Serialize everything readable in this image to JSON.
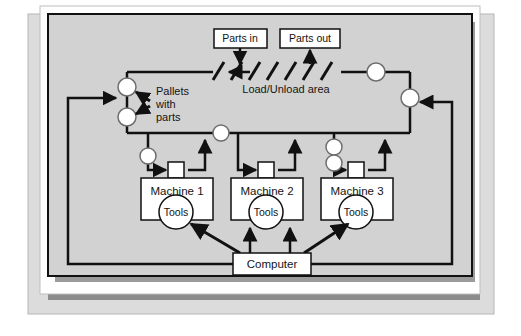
{
  "diagram": {
    "colors": {
      "page_background": "#ffffff",
      "outer_panel": "#dcdcdc",
      "card": "#ffffff",
      "inner_panel": "#d2d2d2",
      "shadow": "#8c8c8c",
      "line": "#111111",
      "node_fill": "#ffffff",
      "box_fill": "#ffffff"
    },
    "boxes": [
      {
        "id": "parts-in",
        "label": "Parts in",
        "x": 214,
        "y": 29,
        "w": 53,
        "h": 19
      },
      {
        "id": "parts-out",
        "label": "Parts out",
        "x": 280,
        "y": 29,
        "w": 60,
        "h": 19
      },
      {
        "id": "machine-1",
        "label": "Machine 1",
        "x": 141,
        "y": 178,
        "w": 72,
        "h": 42
      },
      {
        "id": "machine-2",
        "label": "Machine 2",
        "x": 231,
        "y": 178,
        "w": 72,
        "h": 42
      },
      {
        "id": "machine-3",
        "label": "Machine 3",
        "x": 321,
        "y": 178,
        "w": 72,
        "h": 42
      },
      {
        "id": "computer",
        "label": "Computer",
        "x": 233,
        "y": 253,
        "w": 78,
        "h": 22
      }
    ],
    "tools": [
      {
        "id": "tools-1",
        "label": "Tools",
        "cx": 176,
        "cy": 212,
        "r": 17
      },
      {
        "id": "tools-2",
        "label": "Tools",
        "cx": 266,
        "cy": 212,
        "r": 17
      },
      {
        "id": "tools-3",
        "label": "Tools",
        "cx": 356,
        "cy": 212,
        "r": 17
      }
    ],
    "labels": [
      {
        "id": "load-unload-area",
        "text": "Load/Unload area",
        "x": 286,
        "y": 90
      },
      {
        "id": "pallets-line-1",
        "text": "Pallets",
        "x": 148,
        "y": 92
      },
      {
        "id": "pallets-line-2",
        "text": "with",
        "x": 148,
        "y": 105
      },
      {
        "id": "pallets-line-3",
        "text": "parts",
        "x": 148,
        "y": 118
      }
    ],
    "pallet_nodes": [
      {
        "id": "pallet-node-top-left",
        "cx": 127,
        "cy": 87,
        "r": 9
      },
      {
        "id": "pallet-node-bottom-left",
        "cx": 127,
        "cy": 117,
        "r": 9
      },
      {
        "id": "pallet-node-center",
        "cx": 221,
        "cy": 133,
        "r": 8
      },
      {
        "id": "pallet-node-top-right",
        "cx": 376,
        "cy": 72,
        "r": 9
      },
      {
        "id": "pallet-node-right",
        "cx": 410,
        "cy": 98,
        "r": 9
      },
      {
        "id": "pallet-node-machine-1",
        "cx": 148,
        "cy": 156,
        "r": 8
      },
      {
        "id": "pallet-node-machine-3-upper",
        "cx": 334,
        "cy": 147,
        "r": 8
      },
      {
        "id": "pallet-node-machine-3-lower",
        "cx": 334,
        "cy": 163,
        "r": 8
      }
    ],
    "load_stations": {
      "id": "load-unload-hatching",
      "count": 7,
      "line_y": 72
    },
    "flow_notes": {
      "parts_in_direction": "down",
      "parts_out_direction": "up",
      "conveyor_direction": "counter-clockwise"
    }
  }
}
